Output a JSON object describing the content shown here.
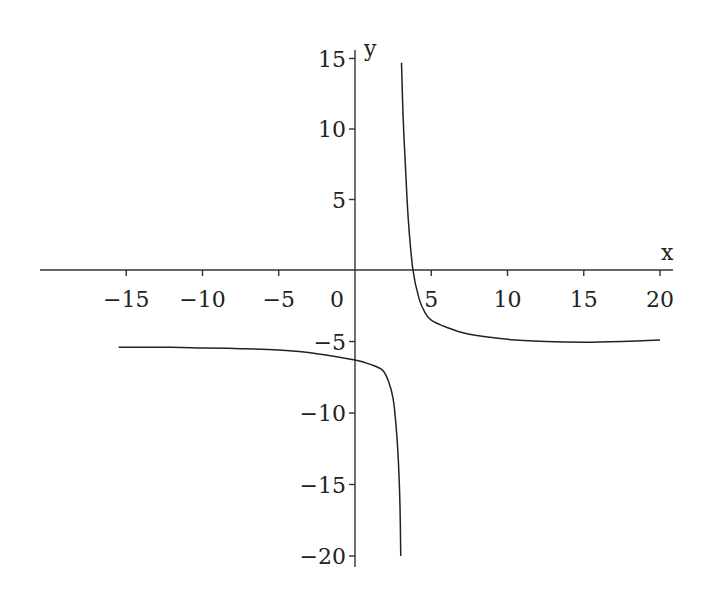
{
  "chart_data": {
    "type": "line",
    "title": "",
    "xlabel": "x",
    "ylabel": "y",
    "xlim": [
      -21,
      21
    ],
    "ylim": [
      -21,
      16
    ],
    "grid": false,
    "legend": null,
    "x_ticks": [
      -15,
      -10,
      -5,
      0,
      5,
      10,
      15,
      20
    ],
    "x_tick_labels": [
      "−15",
      "−10",
      "−5",
      "0",
      "5",
      "10",
      "15",
      "20"
    ],
    "y_ticks": [
      15,
      10,
      5,
      -5,
      -10,
      -15,
      -20
    ],
    "y_tick_labels": [
      "15",
      "10",
      "5",
      "−5",
      "−10",
      "−15",
      "−20"
    ],
    "asymptotes": {
      "vertical_x": 3,
      "horizontal_y": -5
    },
    "series": [
      {
        "name": "left branch",
        "x": [
          -15.5,
          -12,
          -10,
          -7.5,
          -5,
          -2.5,
          0,
          1,
          1.8,
          2.2,
          2.5,
          2.7,
          2.85,
          2.95,
          3.0
        ],
        "y": [
          -5.4,
          -5.4,
          -5.45,
          -5.5,
          -5.6,
          -5.85,
          -6.3,
          -6.6,
          -7.0,
          -7.8,
          -9.0,
          -11.0,
          -13.5,
          -16.5,
          -20.0
        ]
      },
      {
        "name": "right branch",
        "x": [
          3.05,
          3.15,
          3.3,
          3.5,
          3.8,
          4.2,
          4.6,
          5.0,
          6.0,
          7.5,
          10,
          12.5,
          15,
          17.5,
          20
        ],
        "y": [
          14.7,
          11.0,
          7.5,
          3.5,
          0.0,
          -2.0,
          -3.0,
          -3.5,
          -4.0,
          -4.5,
          -4.85,
          -5.0,
          -5.05,
          -5.0,
          -4.9
        ]
      }
    ]
  },
  "axes": {
    "x_label": "x",
    "y_label": "y"
  }
}
